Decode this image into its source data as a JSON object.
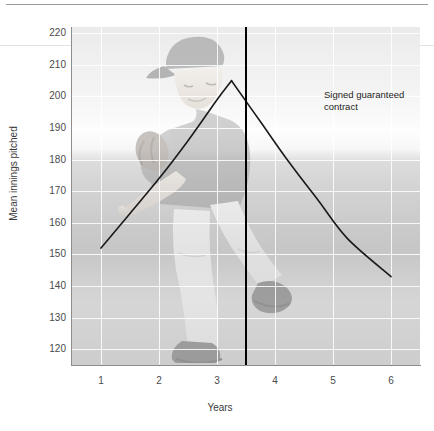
{
  "chart_data": {
    "type": "line",
    "title": "",
    "xlabel": "Years",
    "ylabel": "Mean innings pitched",
    "xlim": [
      0.5,
      6.5
    ],
    "ylim": [
      115,
      222
    ],
    "xticks": [
      "1",
      "2",
      "3",
      "4",
      "5",
      "6"
    ],
    "yticks": [
      "220",
      "210",
      "200",
      "190",
      "180",
      "170",
      "160",
      "150",
      "140",
      "130",
      "120"
    ],
    "grid": true,
    "legend": null,
    "background_image": "baseball-pitcher-watermark",
    "series": [
      {
        "name": "rise-to-contract",
        "x": [
          1.0,
          1.5,
          2.0,
          2.5,
          3.0,
          3.25
        ],
        "values": [
          152,
          163,
          174,
          186,
          199,
          205
        ]
      },
      {
        "name": "decline-after-contract",
        "x": [
          3.25,
          3.75,
          4.25,
          4.75,
          5.25,
          6.0
        ],
        "values": [
          205,
          192,
          179,
          167,
          155,
          143
        ]
      }
    ],
    "annotations": [
      {
        "name": "signed-guaranteed-contract",
        "line1": "Signed guaranteed",
        "line2": "contract",
        "marker": "vertical-line",
        "x": 3.5
      }
    ]
  },
  "axis": {
    "y_title": "Mean innings pitched",
    "x_title": "Years",
    "y_tick_labels": [
      "220",
      "210",
      "200",
      "190",
      "180",
      "170",
      "160",
      "150",
      "140",
      "130",
      "120"
    ],
    "x_tick_labels": [
      "1",
      "2",
      "3",
      "4",
      "5",
      "6"
    ]
  },
  "annotation": {
    "line1": "Signed guaranteed",
    "line2": "contract"
  },
  "colors": {
    "trend_line": "#1a1a1a",
    "event_line": "#000000",
    "grid": "#ffffff",
    "axis": "#8d8d8d",
    "text": "#3a3a3a"
  }
}
